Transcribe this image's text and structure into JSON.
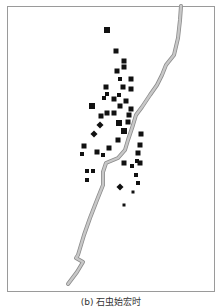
{
  "figure": {
    "caption": "(b) 石虫始宏时",
    "colors": {
      "frame": "#9a9a9a",
      "river_fill": "#c8c8c8",
      "river_stroke": "#8c8c8c",
      "point": "#111111"
    },
    "river_path": [
      [
        181,
        6
      ],
      [
        180,
        20
      ],
      [
        178,
        38
      ],
      [
        174,
        55
      ],
      [
        166,
        65
      ],
      [
        162,
        75
      ],
      [
        157,
        85
      ],
      [
        150,
        95
      ],
      [
        142,
        107
      ],
      [
        136,
        115
      ],
      [
        133,
        125
      ],
      [
        128,
        140
      ],
      [
        125,
        150
      ],
      [
        118,
        158
      ],
      [
        106,
        163
      ],
      [
        103,
        172
      ],
      [
        103,
        185
      ],
      [
        97,
        200
      ],
      [
        90,
        218
      ],
      [
        84,
        235
      ],
      [
        78,
        255
      ],
      [
        76,
        258
      ],
      [
        83,
        262
      ],
      [
        77,
        272
      ],
      [
        68,
        284
      ]
    ],
    "points": [
      {
        "x": 107,
        "y": 30,
        "s": 6,
        "shape": "square"
      },
      {
        "x": 116,
        "y": 51,
        "s": 5,
        "shape": "square"
      },
      {
        "x": 124,
        "y": 61,
        "s": 5,
        "shape": "square"
      },
      {
        "x": 124,
        "y": 67,
        "s": 5,
        "shape": "square"
      },
      {
        "x": 117,
        "y": 71,
        "s": 5,
        "shape": "square"
      },
      {
        "x": 120,
        "y": 79,
        "s": 4,
        "shape": "square"
      },
      {
        "x": 131,
        "y": 79,
        "s": 5,
        "shape": "square"
      },
      {
        "x": 106,
        "y": 87,
        "s": 5,
        "shape": "square"
      },
      {
        "x": 123,
        "y": 87,
        "s": 5,
        "shape": "square"
      },
      {
        "x": 131,
        "y": 89,
        "s": 5,
        "shape": "square"
      },
      {
        "x": 107,
        "y": 94,
        "s": 4,
        "shape": "square"
      },
      {
        "x": 104,
        "y": 98,
        "s": 4,
        "shape": "square"
      },
      {
        "x": 119,
        "y": 95,
        "s": 4,
        "shape": "square"
      },
      {
        "x": 114,
        "y": 99,
        "s": 5,
        "shape": "square"
      },
      {
        "x": 126,
        "y": 101,
        "s": 5,
        "shape": "square"
      },
      {
        "x": 120,
        "y": 106,
        "s": 5,
        "shape": "square"
      },
      {
        "x": 92,
        "y": 106,
        "s": 6,
        "shape": "square"
      },
      {
        "x": 131,
        "y": 109,
        "s": 5,
        "shape": "square"
      },
      {
        "x": 101,
        "y": 116,
        "s": 5,
        "shape": "square"
      },
      {
        "x": 107,
        "y": 113,
        "s": 5,
        "shape": "square"
      },
      {
        "x": 114,
        "y": 113,
        "s": 5,
        "shape": "square"
      },
      {
        "x": 129,
        "y": 115,
        "s": 5,
        "shape": "square"
      },
      {
        "x": 119,
        "y": 123,
        "s": 6,
        "shape": "square"
      },
      {
        "x": 128,
        "y": 122,
        "s": 5,
        "shape": "square"
      },
      {
        "x": 100,
        "y": 125,
        "s": 5,
        "shape": "diamond"
      },
      {
        "x": 124,
        "y": 131,
        "s": 6,
        "shape": "square"
      },
      {
        "x": 94,
        "y": 134,
        "s": 5,
        "shape": "diamond"
      },
      {
        "x": 141,
        "y": 134,
        "s": 5,
        "shape": "square"
      },
      {
        "x": 118,
        "y": 140,
        "s": 5,
        "shape": "square"
      },
      {
        "x": 84,
        "y": 146,
        "s": 5,
        "shape": "square"
      },
      {
        "x": 82,
        "y": 154,
        "s": 4,
        "shape": "square"
      },
      {
        "x": 97,
        "y": 152,
        "s": 5,
        "shape": "square"
      },
      {
        "x": 103,
        "y": 155,
        "s": 4,
        "shape": "square"
      },
      {
        "x": 109,
        "y": 148,
        "s": 5,
        "shape": "square"
      },
      {
        "x": 140,
        "y": 145,
        "s": 5,
        "shape": "square"
      },
      {
        "x": 138,
        "y": 153,
        "s": 5,
        "shape": "square"
      },
      {
        "x": 140,
        "y": 163,
        "s": 5,
        "shape": "square"
      },
      {
        "x": 87,
        "y": 171,
        "s": 4,
        "shape": "square"
      },
      {
        "x": 93,
        "y": 171,
        "s": 4,
        "shape": "square"
      },
      {
        "x": 87,
        "y": 180,
        "s": 4,
        "shape": "square"
      },
      {
        "x": 124,
        "y": 163,
        "s": 5,
        "shape": "square"
      },
      {
        "x": 132,
        "y": 166,
        "s": 4,
        "shape": "square"
      },
      {
        "x": 137,
        "y": 161,
        "s": 4,
        "shape": "square"
      },
      {
        "x": 136,
        "y": 175,
        "s": 4,
        "shape": "square"
      },
      {
        "x": 120,
        "y": 187,
        "s": 5,
        "shape": "diamond"
      },
      {
        "x": 138,
        "y": 183,
        "s": 4,
        "shape": "square"
      },
      {
        "x": 133,
        "y": 192,
        "s": 3,
        "shape": "square"
      },
      {
        "x": 124,
        "y": 205,
        "s": 3,
        "shape": "square"
      }
    ]
  }
}
